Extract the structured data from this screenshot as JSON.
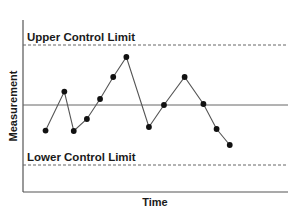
{
  "chart_data": {
    "type": "line",
    "title": "",
    "xlabel": "Time",
    "ylabel": "Measurement",
    "x_ticks": [],
    "y_ticks": [],
    "grid": false,
    "legend": "none",
    "units": "relative (center line = 0, control limits = ±3)",
    "ylim": [
      -4.3,
      4.3
    ],
    "x": [
      1,
      2,
      3,
      4,
      5,
      6,
      7,
      8,
      9,
      10,
      11,
      12,
      13
    ],
    "xlim": [
      -0.2,
      13.9
    ],
    "series": [
      {
        "name": "Measurement",
        "x": [
          1,
          2.0,
          2.5,
          3.2,
          3.9,
          4.6,
          5.3,
          6.5,
          7.3,
          8.4,
          9.4,
          10.1,
          10.8
        ],
        "values": [
          -1.28,
          0.67,
          -1.3,
          -0.7,
          0.3,
          1.4,
          2.4,
          -1.1,
          0.0,
          1.4,
          0.05,
          -1.2,
          -2.0
        ],
        "color": "#222222",
        "marker": "circle"
      }
    ],
    "reference_lines": [
      {
        "name": "Upper Control Limit",
        "value": 3,
        "style": "dashed",
        "label": "Upper Control Limit",
        "label_position": "above-left"
      },
      {
        "name": "Center Line",
        "value": 0,
        "style": "solid",
        "label": ""
      },
      {
        "name": "Lower Control Limit",
        "value": -3,
        "style": "dashed",
        "label": "Lower Control Limit",
        "label_position": "above-left"
      }
    ],
    "colors": {
      "line": "#555555",
      "marker": "#111111",
      "axis": "#555555",
      "reference": "#666666",
      "text": "#1a1a1a"
    }
  }
}
